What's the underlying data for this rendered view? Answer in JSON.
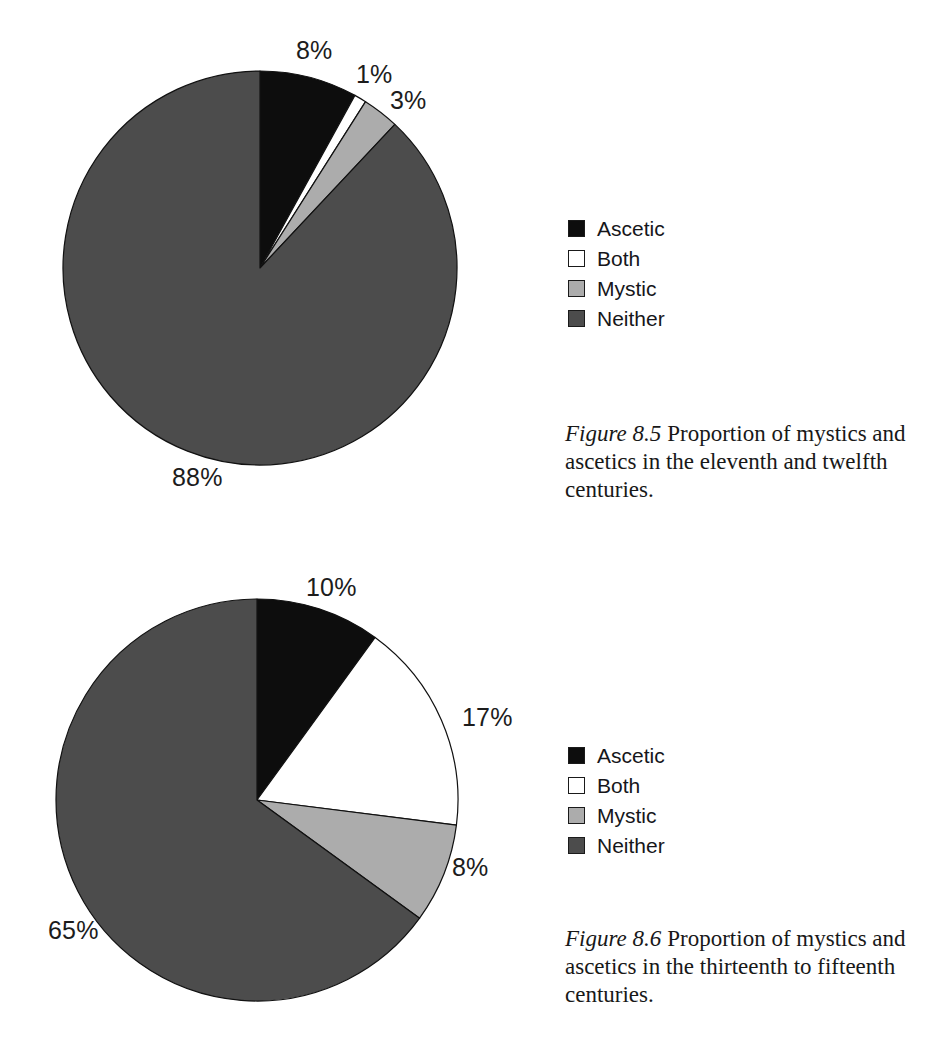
{
  "page": {
    "background": "#ffffff",
    "width": 933,
    "height": 1059
  },
  "palette": {
    "ascetic": "#0d0d0d",
    "both": "#ffffff",
    "mystic": "#acacac",
    "neither": "#4c4c4c",
    "outline": "#111111",
    "text": "#1a1a1a"
  },
  "figures": [
    {
      "id": "figure-8-5",
      "caption_number": "Figure 8.5",
      "caption_text": "Proportion of mystics and ascetics in the eleventh and twelfth centuries.",
      "legend": [
        {
          "label": "Ascetic",
          "color": "#0d0d0d"
        },
        {
          "label": "Both",
          "color": "#ffffff"
        },
        {
          "label": "Mystic",
          "color": "#acacac"
        },
        {
          "label": "Neither",
          "color": "#4c4c4c"
        }
      ],
      "labels": {
        "ascetic": "8%",
        "both": "1%",
        "mystic": "3%",
        "neither": "88%"
      }
    },
    {
      "id": "figure-8-6",
      "caption_number": "Figure 8.6",
      "caption_text": "Proportion of mystics and ascetics in the thirteenth to fifteenth centuries.",
      "legend": [
        {
          "label": "Ascetic",
          "color": "#0d0d0d"
        },
        {
          "label": "Both",
          "color": "#ffffff"
        },
        {
          "label": "Mystic",
          "color": "#acacac"
        },
        {
          "label": "Neither",
          "color": "#4c4c4c"
        }
      ],
      "labels": {
        "ascetic": "10%",
        "both": "17%",
        "mystic": "8%",
        "neither": "65%"
      }
    }
  ],
  "chart_data": [
    {
      "type": "pie",
      "title": "Figure 8.5 Proportion of mystics and ascetics in the eleventh and twelfth centuries.",
      "categories": [
        "Ascetic",
        "Both",
        "Mystic",
        "Neither"
      ],
      "values": [
        8,
        1,
        3,
        88
      ],
      "value_labels": [
        "8%",
        "1%",
        "3%",
        "88%"
      ],
      "units": "percent",
      "colors": [
        "#0d0d0d",
        "#ffffff",
        "#acacac",
        "#4c4c4c"
      ],
      "start_angle_deg": 0,
      "direction": "clockwise",
      "legend_position": "right",
      "grid": false,
      "xlabel": "",
      "ylabel": ""
    },
    {
      "type": "pie",
      "title": "Figure 8.6 Proportion of mystics and ascetics in the thirteenth to fifteenth centuries.",
      "categories": [
        "Ascetic",
        "Both",
        "Mystic",
        "Neither"
      ],
      "values": [
        10,
        17,
        8,
        65
      ],
      "value_labels": [
        "10%",
        "17%",
        "8%",
        "65%"
      ],
      "units": "percent",
      "colors": [
        "#0d0d0d",
        "#ffffff",
        "#acacac",
        "#4c4c4c"
      ],
      "start_angle_deg": 0,
      "direction": "clockwise",
      "legend_position": "right",
      "grid": false,
      "xlabel": "",
      "ylabel": ""
    }
  ]
}
